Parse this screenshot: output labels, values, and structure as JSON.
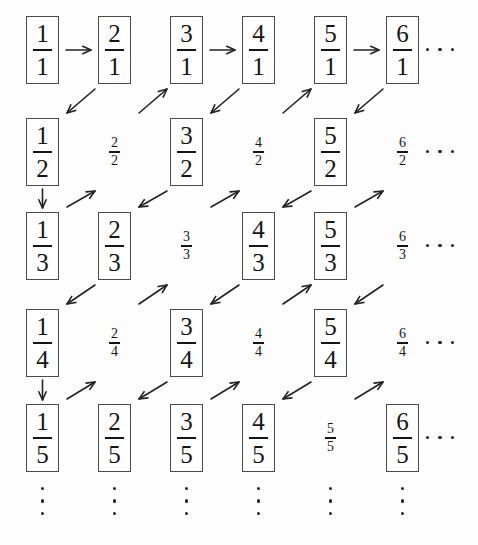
{
  "figure": {
    "columns": 6,
    "rows": 5,
    "ellipsis_glyph": "···",
    "box_color": "#4a4a4a",
    "ink_color": "#151515",
    "background": "#ffffff"
  },
  "grid": {
    "rows": [
      {
        "denominator": "1",
        "cells": [
          {
            "numerator": "1",
            "denominator": "1",
            "label": "1/1",
            "boxed": true
          },
          {
            "numerator": "2",
            "denominator": "1",
            "label": "2/1",
            "boxed": true
          },
          {
            "numerator": "3",
            "denominator": "1",
            "label": "3/1",
            "boxed": true
          },
          {
            "numerator": "4",
            "denominator": "1",
            "label": "4/1",
            "boxed": true
          },
          {
            "numerator": "5",
            "denominator": "1",
            "label": "5/1",
            "boxed": true
          },
          {
            "numerator": "6",
            "denominator": "1",
            "label": "6/1",
            "boxed": true
          }
        ],
        "row_ellipsis": "···"
      },
      {
        "denominator": "2",
        "cells": [
          {
            "numerator": "1",
            "denominator": "2",
            "label": "1/2",
            "boxed": true
          },
          {
            "numerator": "2",
            "denominator": "2",
            "label": "2/2",
            "boxed": false
          },
          {
            "numerator": "3",
            "denominator": "2",
            "label": "3/2",
            "boxed": true
          },
          {
            "numerator": "4",
            "denominator": "2",
            "label": "4/2",
            "boxed": false
          },
          {
            "numerator": "5",
            "denominator": "2",
            "label": "5/2",
            "boxed": true
          },
          {
            "numerator": "6",
            "denominator": "2",
            "label": "6/2",
            "boxed": false
          }
        ],
        "row_ellipsis": "···"
      },
      {
        "denominator": "3",
        "cells": [
          {
            "numerator": "1",
            "denominator": "3",
            "label": "1/3",
            "boxed": true
          },
          {
            "numerator": "2",
            "denominator": "3",
            "label": "2/3",
            "boxed": true
          },
          {
            "numerator": "3",
            "denominator": "3",
            "label": "3/3",
            "boxed": false
          },
          {
            "numerator": "4",
            "denominator": "3",
            "label": "4/3",
            "boxed": true
          },
          {
            "numerator": "5",
            "denominator": "3",
            "label": "5/3",
            "boxed": true
          },
          {
            "numerator": "6",
            "denominator": "3",
            "label": "6/3",
            "boxed": false
          }
        ],
        "row_ellipsis": "···"
      },
      {
        "denominator": "4",
        "cells": [
          {
            "numerator": "1",
            "denominator": "4",
            "label": "1/4",
            "boxed": true
          },
          {
            "numerator": "2",
            "denominator": "4",
            "label": "2/4",
            "boxed": false
          },
          {
            "numerator": "3",
            "denominator": "4",
            "label": "3/4",
            "boxed": true
          },
          {
            "numerator": "4",
            "denominator": "4",
            "label": "4/4",
            "boxed": false
          },
          {
            "numerator": "5",
            "denominator": "4",
            "label": "5/4",
            "boxed": true
          },
          {
            "numerator": "6",
            "denominator": "4",
            "label": "6/4",
            "boxed": false
          }
        ],
        "row_ellipsis": "···"
      },
      {
        "denominator": "5",
        "cells": [
          {
            "numerator": "1",
            "denominator": "5",
            "label": "1/5",
            "boxed": true
          },
          {
            "numerator": "2",
            "denominator": "5",
            "label": "2/5",
            "boxed": true
          },
          {
            "numerator": "3",
            "denominator": "5",
            "label": "3/5",
            "boxed": true
          },
          {
            "numerator": "4",
            "denominator": "5",
            "label": "4/5",
            "boxed": true
          },
          {
            "numerator": "5",
            "denominator": "5",
            "label": "5/5",
            "boxed": false
          },
          {
            "numerator": "6",
            "denominator": "5",
            "label": "6/5",
            "boxed": true
          }
        ],
        "row_ellipsis": "···"
      }
    ],
    "column_continuation": [
      "⋮",
      "⋮",
      "⋮",
      "⋮",
      "⋮",
      "⋮"
    ]
  },
  "arrows": [
    {
      "name": "arrow-right-1-1-to-2-1",
      "direction": "right",
      "from": "1/1",
      "to": "2/1"
    },
    {
      "name": "arrow-right-3-1-to-4-1",
      "direction": "right",
      "from": "3/1",
      "to": "4/1"
    },
    {
      "name": "arrow-right-5-1-to-6-1",
      "direction": "right",
      "from": "5/1",
      "to": "6/1"
    },
    {
      "name": "arrow-diag-down-left-2-1-to-1-2",
      "direction": "down-left",
      "from": "2/1",
      "to": "1/2"
    },
    {
      "name": "arrow-diag-up-right-1-2-to-3-1",
      "direction": "up-right",
      "from": "2/2",
      "to": "3/1"
    },
    {
      "name": "arrow-diag-down-left-4-1-to-3-2",
      "direction": "down-left",
      "from": "4/1",
      "to": "3/2"
    },
    {
      "name": "arrow-diag-up-right-4-2-to-5-1",
      "direction": "up-right",
      "from": "4/2",
      "to": "5/1"
    },
    {
      "name": "arrow-diag-down-left-6-1-to-5-2",
      "direction": "down-left",
      "from": "6/1",
      "to": "5/2"
    },
    {
      "name": "arrow-down-1-2-to-1-3",
      "direction": "down",
      "from": "1/2",
      "to": "1/3"
    },
    {
      "name": "arrow-diag-up-right-2-3-to-2-2",
      "direction": "up-right",
      "from": "2/3",
      "to": "2/2"
    },
    {
      "name": "arrow-diag-down-left-3-2-to-2-3",
      "direction": "down-left",
      "from": "3/2",
      "to": "2/3"
    },
    {
      "name": "arrow-diag-up-right-4-3-to-4-2",
      "direction": "up-right",
      "from": "4/3",
      "to": "4/2"
    },
    {
      "name": "arrow-diag-down-left-5-2-to-4-3",
      "direction": "down-left",
      "from": "5/2",
      "to": "4/3"
    },
    {
      "name": "arrow-diag-up-right-6-3-to-6-2",
      "direction": "up-right",
      "from": "6/3",
      "to": "6/2"
    },
    {
      "name": "arrow-diag-down-left-2-3-to-1-4",
      "direction": "down-left",
      "from": "2/3",
      "to": "1/4"
    },
    {
      "name": "arrow-diag-up-right-2-4-to-3-3",
      "direction": "up-right",
      "from": "2/4",
      "to": "3/3"
    },
    {
      "name": "arrow-diag-down-left-4-3-to-3-4",
      "direction": "down-left",
      "from": "4/3",
      "to": "3/4"
    },
    {
      "name": "arrow-diag-up-right-4-4-to-5-3",
      "direction": "up-right",
      "from": "4/4",
      "to": "5/3"
    },
    {
      "name": "arrow-diag-down-left-6-3-to-5-4",
      "direction": "down-left",
      "from": "6/3",
      "to": "5/4"
    },
    {
      "name": "arrow-down-1-4-to-1-5",
      "direction": "down",
      "from": "1/4",
      "to": "1/5"
    },
    {
      "name": "arrow-diag-up-right-2-5-to-2-4",
      "direction": "up-right",
      "from": "2/5",
      "to": "2/4"
    },
    {
      "name": "arrow-diag-down-left-3-4-to-2-5",
      "direction": "down-left",
      "from": "3/4",
      "to": "2/5"
    },
    {
      "name": "arrow-diag-up-right-4-5-to-4-4",
      "direction": "up-right",
      "from": "4/5",
      "to": "4/4"
    },
    {
      "name": "arrow-diag-down-left-5-4-to-4-5",
      "direction": "down-left",
      "from": "5/4",
      "to": "4/5"
    },
    {
      "name": "arrow-diag-up-right-6-5-to-6-4",
      "direction": "up-right",
      "from": "6/5",
      "to": "6/4"
    }
  ],
  "layout": {
    "column_x": [
      26,
      98,
      170,
      242,
      314,
      386
    ],
    "row_y": [
      16,
      118,
      212,
      309,
      404
    ],
    "cell_w": 33,
    "cell_h": 68,
    "row_ellipsis_x": 426,
    "vdots_y": 487
  }
}
